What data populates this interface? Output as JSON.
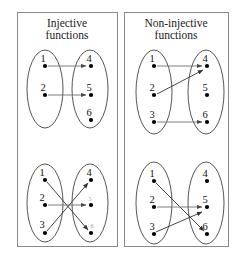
{
  "figure": {
    "width": 238,
    "height": 269,
    "background": "#ffffff",
    "frame_color": "#8a8a8a",
    "ellipse_color": "#2b2b2b",
    "dot_color": "#000000",
    "arrow_color": "#333333"
  },
  "panels": [
    {
      "id": "injective",
      "title_line1": "Injective",
      "title_line2": "functions",
      "diagrams": [
        {
          "id": "injective-top",
          "domain_labels": [
            "1",
            "2"
          ],
          "codomain_labels": [
            "4",
            "5",
            "6"
          ],
          "mappings": [
            {
              "from": "1",
              "to": "4"
            },
            {
              "from": "2",
              "to": "5"
            }
          ]
        },
        {
          "id": "injective-bottom",
          "domain_labels": [
            "1",
            "2",
            "3"
          ],
          "codomain_labels": [
            "4",
            "5",
            "6"
          ],
          "mappings": [
            {
              "from": "1",
              "to": "6"
            },
            {
              "from": "2",
              "to": "5"
            },
            {
              "from": "3",
              "to": "4"
            }
          ]
        }
      ]
    },
    {
      "id": "non-injective",
      "title_line1": "Non-injective",
      "title_line2": "functions",
      "diagrams": [
        {
          "id": "non-injective-top",
          "domain_labels": [
            "1",
            "2",
            "3"
          ],
          "codomain_labels": [
            "4",
            "5",
            "6"
          ],
          "mappings": [
            {
              "from": "1",
              "to": "4"
            },
            {
              "from": "2",
              "to": "4"
            },
            {
              "from": "3",
              "to": "6"
            }
          ]
        },
        {
          "id": "non-injective-bottom",
          "domain_labels": [
            "1",
            "2",
            "3"
          ],
          "codomain_labels": [
            "4",
            "5",
            "6"
          ],
          "mappings": [
            {
              "from": "1",
              "to": "6"
            },
            {
              "from": "2",
              "to": "5"
            },
            {
              "from": "3",
              "to": "5"
            }
          ]
        }
      ]
    }
  ],
  "labels": {
    "p0_title1": "Injective",
    "p0_title2": "functions",
    "p1_title1": "Non-injective",
    "p1_title2": "functions",
    "n1": "1",
    "n2": "2",
    "n3": "3",
    "n4": "4",
    "n5": "5",
    "n6": "6"
  }
}
